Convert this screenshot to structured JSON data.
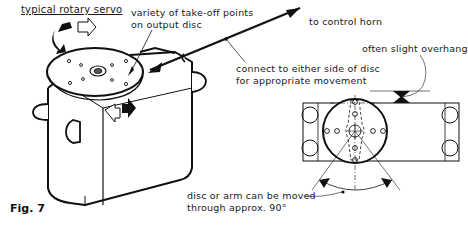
{
  "figure": {
    "label": "Fig. 7",
    "title": "typical rotary servo"
  },
  "annotations": {
    "takeoff_line1": "variety of take-off points",
    "takeoff_line2": "on output disc",
    "control_horn": "to control horn",
    "connect_line1": "connect to either side of disc",
    "connect_line2": "for appropriate movement",
    "overhang": "often slight overhang",
    "movement_line1": "disc or arm can be moved",
    "movement_line2": "through approx. 90°"
  },
  "icons": {
    "rotation_arrow_top": "curved-rotation-arrows",
    "rotation_arrow_side": "curved-rotation-arrows",
    "pushrod_arrow": "arrow",
    "overhang_marker": "opposing-triangles",
    "angle_arrows": "arc-arrows"
  },
  "colors": {
    "ink": "#111111",
    "background": "#ffffff"
  }
}
